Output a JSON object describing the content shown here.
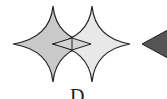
{
  "figure": {
    "label": "D",
    "shapes": [
      {
        "name": "left-astroid",
        "fill": "#c9c9c9",
        "stroke": "#222222"
      },
      {
        "name": "right-astroid",
        "fill": "#e6e6e6",
        "stroke": "#222222"
      },
      {
        "name": "intersection-diamond",
        "stroke": "#222222"
      },
      {
        "name": "right-triangle",
        "fill": "#555555",
        "stroke": "#222222"
      }
    ]
  }
}
